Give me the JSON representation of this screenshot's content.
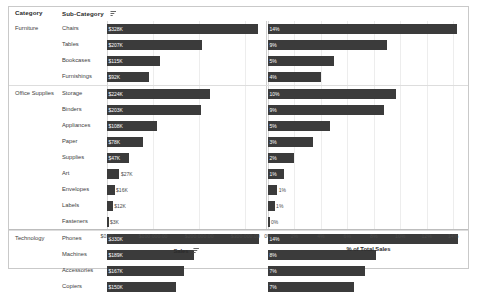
{
  "header": {
    "category_label": "Category",
    "subcategory_label": "Sub-Category",
    "sort_icon": "sort-descending-icon"
  },
  "axes": {
    "sales": {
      "title": "Sales",
      "sort_icon": "sort-descending-icon",
      "ticks": [
        "$0.00",
        "$100,000.00",
        "$200,000.00",
        "$300,000.00"
      ],
      "tick_values": [
        0,
        100000,
        200000,
        300000
      ],
      "max": 345000
    },
    "percent": {
      "title": "% of Total Sales",
      "ticks": [
        "0%",
        "2%",
        "4%",
        "6%",
        "8%",
        "10%",
        "12%",
        "14%"
      ],
      "tick_values": [
        0,
        2,
        4,
        6,
        8,
        10,
        12,
        14
      ],
      "max": 15.2
    }
  },
  "colors": {
    "bar": "#3b3b3b",
    "gridline": "#ededed",
    "border": "#c9c9c9",
    "text": "#404040"
  },
  "chart_data": {
    "type": "bar",
    "title": "",
    "xlabel": "Sales",
    "ylabel": "Sub-Category",
    "grid": true,
    "legend": "none",
    "orientation": "horizontal",
    "categories": [
      "Chairs",
      "Tables",
      "Bookcases",
      "Furnishings",
      "Storage",
      "Binders",
      "Appliances",
      "Paper",
      "Supplies",
      "Art",
      "Envelopes",
      "Labels",
      "Fasteners",
      "Phones",
      "Machines",
      "Accessories",
      "Copiers"
    ],
    "groups": [
      {
        "name": "Furniture",
        "count": 4
      },
      {
        "name": "Office Supplies",
        "count": 9
      },
      {
        "name": "Technology",
        "count": 4
      }
    ],
    "series": [
      {
        "name": "Sales",
        "unit": "USD",
        "values": [
          328449,
          206966,
          114880,
          91705,
          223844,
          203413,
          107532,
          78479,
          46674,
          27119,
          16476,
          12486,
          3024,
          330007,
          189239,
          167380,
          149528
        ],
        "labels": [
          "$328K",
          "$207K",
          "$115K",
          "$92K",
          "$224K",
          "$203K",
          "$108K",
          "$78K",
          "$47K",
          "$27K",
          "$16K",
          "$12K",
          "$3K",
          "$330K",
          "$189K",
          "$167K",
          "$150K"
        ]
      },
      {
        "name": "% of Total Sales",
        "unit": "percent",
        "values": [
          14.3,
          9.0,
          5.0,
          4.0,
          9.7,
          8.8,
          4.7,
          3.4,
          2.0,
          1.2,
          0.7,
          0.5,
          0.1,
          14.4,
          8.2,
          7.3,
          6.5
        ],
        "labels": [
          "14%",
          "9%",
          "5%",
          "4%",
          "10%",
          "9%",
          "5%",
          "3%",
          "2%",
          "1%",
          "1%",
          "1%",
          "0%",
          "14%",
          "8%",
          "7%",
          "7%"
        ]
      }
    ]
  }
}
